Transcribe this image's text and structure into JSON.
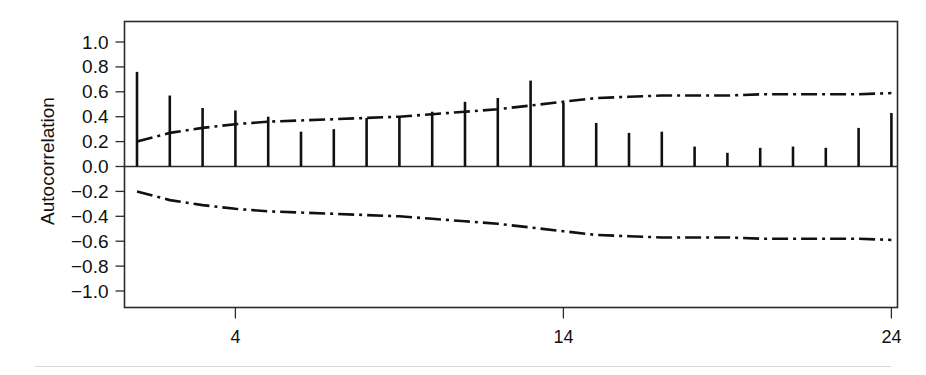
{
  "figure": {
    "ylabel": "Autocorrelation",
    "background_color": "#ffffff",
    "foreground_color": "#111111"
  },
  "axes": {
    "y_tick_labels": [
      "1.0",
      "0.8",
      "0.6",
      "0.4",
      "0.2",
      "0.0",
      "−0.2",
      "−0.4",
      "−0.6",
      "−0.8",
      "−1.0"
    ],
    "x_tick_labels": [
      "4",
      "14",
      "24"
    ]
  },
  "chart_data": {
    "type": "bar",
    "title": "",
    "subtitle": "",
    "xlabel": "",
    "ylabel": "Autocorrelation",
    "xlim": [
      0.5,
      24.6
    ],
    "ylim": [
      -1.0,
      1.0
    ],
    "grid": false,
    "legend": "none",
    "plot_style": "R stats acf / correlogram, vertical spike bars with dash-dot confidence bands",
    "y_ticks": [
      1.0,
      0.8,
      0.6,
      0.4,
      0.2,
      0.0,
      -0.2,
      -0.4,
      -0.6,
      -0.8,
      -1.0
    ],
    "x_ticks": [
      4,
      14,
      24
    ],
    "categories": [
      1,
      2,
      3,
      4,
      5,
      6,
      7,
      8,
      9,
      10,
      11,
      12,
      13,
      14,
      15,
      16,
      17,
      18,
      19,
      20,
      21,
      22,
      23,
      24
    ],
    "values": [
      0.76,
      0.57,
      0.47,
      0.45,
      0.4,
      0.28,
      0.3,
      0.39,
      0.4,
      0.44,
      0.52,
      0.55,
      0.69,
      0.51,
      0.35,
      0.27,
      0.28,
      0.16,
      0.11,
      0.15,
      0.16,
      0.15,
      0.31,
      0.43
    ],
    "series": [
      {
        "name": "Autocorrelation",
        "type": "spike",
        "values": [
          0.76,
          0.57,
          0.47,
          0.45,
          0.4,
          0.28,
          0.3,
          0.39,
          0.4,
          0.44,
          0.52,
          0.55,
          0.69,
          0.51,
          0.35,
          0.27,
          0.28,
          0.16,
          0.11,
          0.15,
          0.16,
          0.15,
          0.31,
          0.43
        ]
      },
      {
        "name": "Upper confidence band",
        "type": "dashdot-line",
        "values": [
          0.2,
          0.27,
          0.31,
          0.34,
          0.36,
          0.37,
          0.38,
          0.39,
          0.4,
          0.42,
          0.44,
          0.46,
          0.49,
          0.52,
          0.55,
          0.56,
          0.57,
          0.57,
          0.57,
          0.58,
          0.58,
          0.58,
          0.58,
          0.59
        ]
      },
      {
        "name": "Lower confidence band",
        "type": "dashdot-line",
        "values": [
          -0.2,
          -0.27,
          -0.31,
          -0.34,
          -0.36,
          -0.37,
          -0.38,
          -0.39,
          -0.4,
          -0.42,
          -0.44,
          -0.46,
          -0.49,
          -0.52,
          -0.55,
          -0.56,
          -0.57,
          -0.57,
          -0.57,
          -0.58,
          -0.58,
          -0.58,
          -0.58,
          -0.59
        ]
      }
    ]
  }
}
